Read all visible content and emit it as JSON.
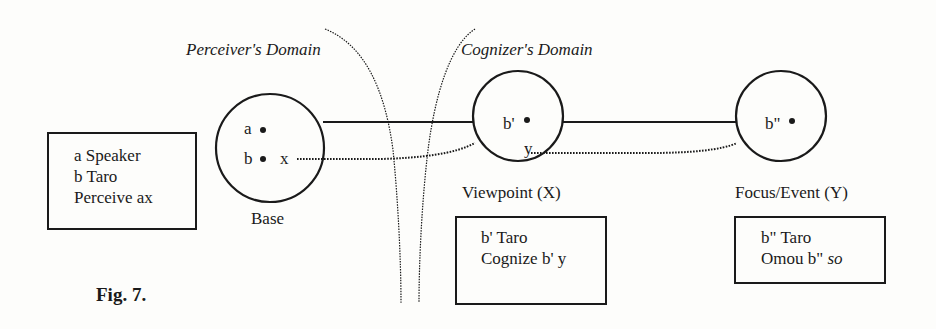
{
  "figure": {
    "caption": "Fig. 7."
  },
  "domains": {
    "perceiver": "Perceiver's Domain",
    "cognizer": "Cognizer's Domain"
  },
  "nodes": {
    "base": {
      "label": "Base",
      "point_a": "a",
      "point_b": "b",
      "var_x": "x"
    },
    "viewpoint": {
      "label": "Viewpoint (X)",
      "point": "b'",
      "var_y": "y"
    },
    "focus": {
      "label": "Focus/Event (Y)",
      "point": "b\""
    }
  },
  "boxes": {
    "base": {
      "lines": [
        "a Speaker",
        "b Taro",
        "Perceive ax"
      ]
    },
    "viewpoint": {
      "lines": [
        "b' Taro",
        "Cognize b' y"
      ]
    },
    "focus": {
      "line1": "b\" Taro",
      "line2_prefix": "Omou b\" ",
      "line2_italic": "so"
    }
  },
  "colors": {
    "ink": "#1a1a1a",
    "background": "#fdfdfb"
  }
}
